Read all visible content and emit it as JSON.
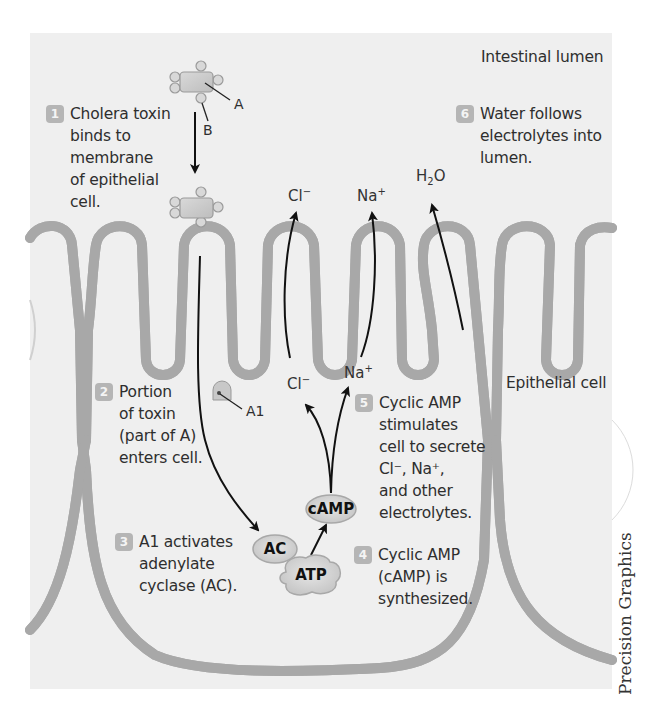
{
  "figure": {
    "region_labels": {
      "lumen": "Intestinal lumen",
      "cell": "Epithelial cell"
    },
    "steps": [
      {
        "number": "1",
        "text": "Cholera toxin\nbinds to\nmembrane\nof epithelial\ncell."
      },
      {
        "number": "2",
        "text": "Portion\nof toxin\n(part of A)\nenters cell."
      },
      {
        "number": "3",
        "text": "A1 activates\nadenylate\ncyclase (AC)."
      },
      {
        "number": "4",
        "text": "Cyclic AMP\n(cAMP) is\nsynthesized."
      },
      {
        "number": "5",
        "text": "Cyclic AMP\nstimulates\ncell to secrete\nCl⁻, Na⁺,\nand other\nelectrolytes."
      },
      {
        "number": "6",
        "text": "Water follows\nelectrolytes into\nlumen."
      }
    ],
    "toxin_parts": {
      "a": "A",
      "b": "B",
      "a1": "A1"
    },
    "molecules": {
      "ac": "AC",
      "camp": "cAMP",
      "atp": "ATP"
    },
    "ions": {
      "cl_out": {
        "base": "Cl",
        "charge": "−"
      },
      "na_out": {
        "base": "Na",
        "charge": "+"
      },
      "cl_in": {
        "base": "Cl",
        "charge": "−"
      },
      "na_in": {
        "base": "Na",
        "charge": "+"
      },
      "water": {
        "base": "H",
        "sub": "2",
        "rest": "O"
      }
    },
    "credit": "Precision Graphics",
    "colors": {
      "panel": "#efefef",
      "membrane_fill": "#d6d6d6",
      "membrane_edge": "#a8a8a8",
      "badge": "#b5b5b5",
      "arrow": "#111111"
    }
  }
}
